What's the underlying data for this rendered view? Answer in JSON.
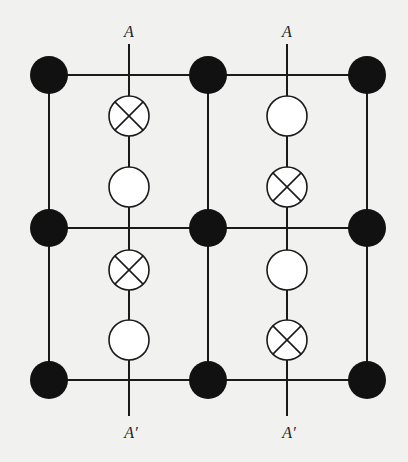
{
  "diagram": {
    "labels": {
      "top_left": "A",
      "top_right": "A",
      "bottom_left": "A′",
      "bottom_right": "A′"
    },
    "colors": {
      "background": "#f1f1ef",
      "line": "#1a1a1a",
      "filled_node": "#111111",
      "open_node_fill": "#ffffff"
    },
    "grid": {
      "columns_x": [
        49,
        208,
        367
      ],
      "rows_y": [
        75,
        228,
        380
      ],
      "filled_node_radius": 19
    },
    "section_lines": [
      {
        "x": 129,
        "top_label": "A",
        "bottom_label": "A′",
        "symbols": [
          {
            "type": "crossed-circle",
            "y": 116
          },
          {
            "type": "open-circle",
            "y": 187
          },
          {
            "type": "crossed-circle",
            "y": 270
          },
          {
            "type": "open-circle",
            "y": 340
          }
        ]
      },
      {
        "x": 287,
        "top_label": "A",
        "bottom_label": "A′",
        "symbols": [
          {
            "type": "open-circle",
            "y": 116
          },
          {
            "type": "crossed-circle",
            "y": 187
          },
          {
            "type": "open-circle",
            "y": 270
          },
          {
            "type": "crossed-circle",
            "y": 340
          }
        ]
      }
    ]
  }
}
